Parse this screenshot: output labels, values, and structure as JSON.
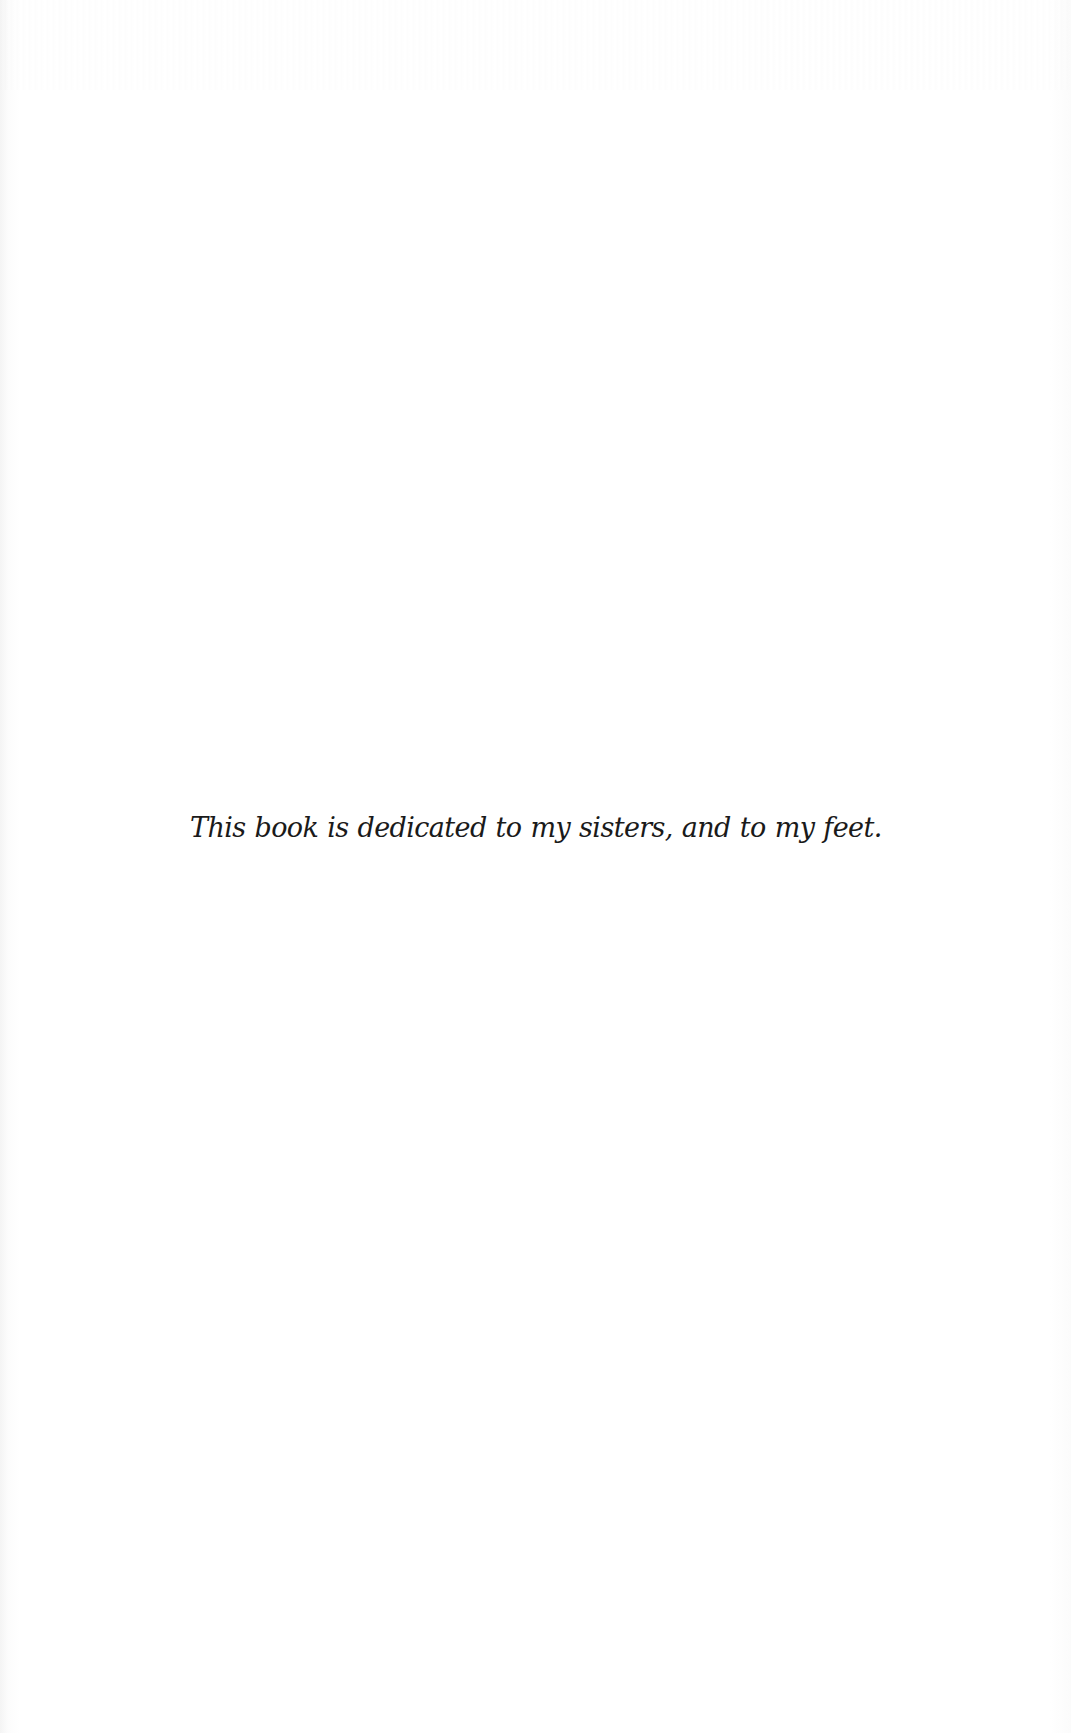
{
  "page": {
    "type": "dedication",
    "background_color": "#ffffff",
    "text_color": "#1a1a1a"
  },
  "dedication": {
    "text": "This book is dedicated to my sisters, and to my feet."
  }
}
